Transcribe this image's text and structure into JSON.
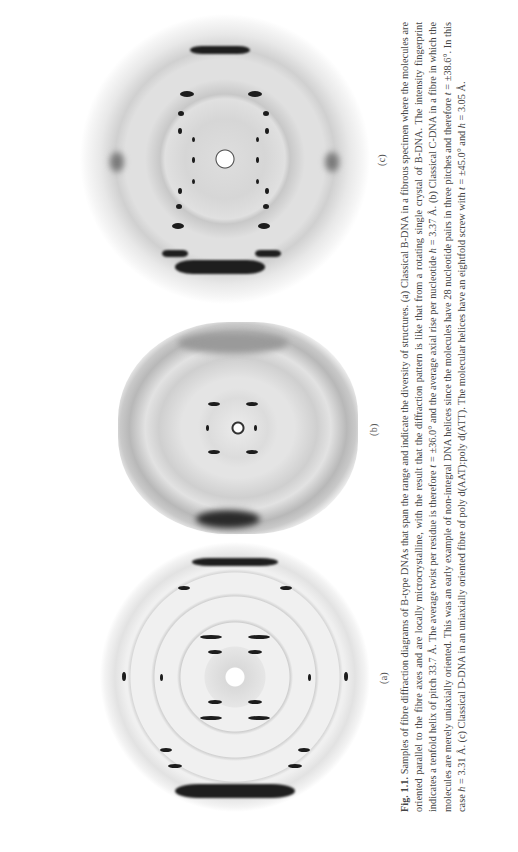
{
  "figure": {
    "orientation": "rotated-90-ccw",
    "panels": [
      {
        "id": "a",
        "label": "(a)",
        "description": "Classical B-DNA fibre diffraction pattern"
      },
      {
        "id": "b",
        "label": "(b)",
        "description": "Classical C-DNA fibre diffraction pattern"
      },
      {
        "id": "c",
        "label": "(c)",
        "description": "Classical D-DNA fibre diffraction pattern"
      }
    ],
    "caption": {
      "label": "Fig. 1.1.",
      "segments": [
        {
          "text": " Samples of fibre diffraction diagrams of B-type DNAs that span the range and indicate the diversity of structures. (a) Classical B-DNA in a fibrous specimen where the molecules are oriented parallel to the fibre axes and are locally microcrystalline, with the result that the diffraction pattern is like that from a rotating single crystal of B-DNA. The intensity fingerprint indicates a tenfold helix of pitch 33.7 Å. The average twist per residue is therefore "
        },
        {
          "text": "t",
          "italic": true
        },
        {
          "text": " = ±36.0° and the average axial rise per nucleotide "
        },
        {
          "text": "h",
          "italic": true
        },
        {
          "text": " = 3.37 Å. (b) Classical C-DNA in a fibre in which the molecules are merely uniaxially oriented. This was an early example of non-integral DNA helices since the molecules have 28 nucleotide pairs in three pitches and therefore "
        },
        {
          "text": "t",
          "italic": true
        },
        {
          "text": " = ±38.6°. In this case "
        },
        {
          "text": "h",
          "italic": true
        },
        {
          "text": " = 3.31 Å. (c) Classical D-DNA in an uniaxially oriented fibre of poly d(AAT):poly d(ATT). The molecular helices have an eightfold screw with "
        },
        {
          "text": "t",
          "italic": true
        },
        {
          "text": " = ±45.0° and "
        },
        {
          "text": "h",
          "italic": true
        },
        {
          "text": " = 3.05 Å."
        }
      ]
    }
  }
}
